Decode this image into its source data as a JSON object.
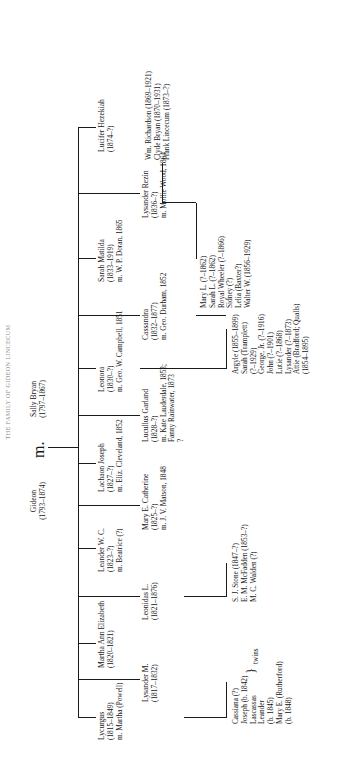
{
  "caption": "THE FAMILY OF GIDEON LINCECUM",
  "root": {
    "father": {
      "name": "Gideon",
      "dates": "(1793–1874)"
    },
    "marriage_symbol": "m.",
    "mother": {
      "name": "Sally Bryan",
      "dates": "(1797–1867)"
    }
  },
  "generation2": [
    {
      "name": "Lycurgus",
      "dates": "(1815–1849)",
      "spouse": "m. Martha (Powell)"
    },
    {
      "name": "Martha Ann Elizabeth",
      "dates": "(1820–1821)",
      "spouse": ""
    },
    {
      "name": "Lysander M.",
      "dates": "(1817–1832)",
      "spouse": ""
    },
    {
      "name": "Leander W. C.",
      "dates": "(1823–?)",
      "spouse": "m. Beatrice (?)"
    },
    {
      "name": "Leonidas L.",
      "dates": "(1821–1876)",
      "spouse": ""
    },
    {
      "name": "Lachaon Joseph",
      "dates": "(1827–?)",
      "spouse": "m. Eliz. Cleveland, 1852"
    },
    {
      "name": "Mary E. Catherine",
      "dates": "(1825–?)",
      "spouse": "m. J. V. Matson, 1848"
    },
    {
      "name": "Lucullus Garland",
      "dates": "(1828–?)",
      "spouse": "m. Kate Lauderdale, 1853;",
      "spouse2": "Fanny Rainwater, 1873",
      "spouse3": "?"
    },
    {
      "name": "Leonora",
      "dates": "(1830–?)",
      "spouse": "m. Geo. W. Campbell, 1851"
    },
    {
      "name": "Cassandra",
      "dates": "(1832–1877)",
      "spouse": "m. Geo. Durham, 1852"
    },
    {
      "name": "Sarah Matilda",
      "dates": "(1833–1919)",
      "spouse": "m. W. P. Doran, 1865"
    },
    {
      "name": "Lysander Rezin",
      "dates": "(1836–?)",
      "spouse": "m. Mollie Wood, 1864"
    },
    {
      "name": "Lucifer Hezekiah",
      "dates": "(1874–?)",
      "spouse": ""
    }
  ],
  "children_groups": [
    {
      "parent": "Lycurgus",
      "items": [
        "Cassiana (?)",
        "Joseph (b. 1842)",
        "Lascassas",
        "Leander",
        "(b. 1845)",
        "Mary E. (Rutherford)",
        "(b. 1848)"
      ],
      "twins_label": "twins"
    },
    {
      "parent": "Leonidas L.",
      "items": [
        "S. J. Stone (1847–?)",
        "E. M. McFadden (1853–?)",
        "M. C. Walden (?)"
      ]
    },
    {
      "parent": "Leonora",
      "items": [
        "Argyle (1855–1899)",
        "Sarah (Tramplett)",
        "(?–1929)",
        "George, Jr. (?–1916)",
        "John (?–1901)",
        "Lutie (?–1868)",
        "Lysander (?–1873)",
        "Attie (Bradford; Qualls)",
        "(1854–1895)"
      ]
    },
    {
      "parent": "Cassandra",
      "items": [
        "Mary L. (?–1862)",
        "Sarah L. (?–1862)",
        "Royal Wheeler (?–1866)",
        "Sidney (?)",
        "Lelia (Baxter?)",
        "Walter W. (1856–1929)"
      ]
    },
    {
      "parent": "Sarah Matilda",
      "items": [
        "Wm. Richardson (1869–1921)",
        "Clyde Bryan (1870–1931)",
        "Frank Lincecum (1873–?)"
      ]
    }
  ],
  "colors": {
    "ink": "#1a1a1a",
    "paper": "#ffffff",
    "caption": "#8e8e8e"
  }
}
